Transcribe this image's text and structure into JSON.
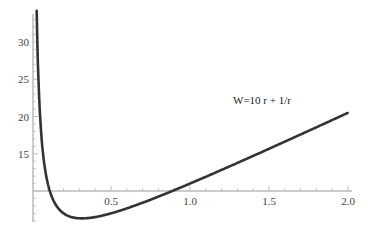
{
  "chart_data": {
    "type": "line",
    "title": "",
    "xlabel": "",
    "ylabel": "",
    "annotation": "W=10 r + 1/r",
    "function": "W = 10*r + 1/r",
    "xlim": [
      0,
      2.0
    ],
    "ylim": [
      6,
      33
    ],
    "axes_origin": {
      "x": 0,
      "y": 10
    },
    "x_ticks": [
      "0.5",
      "1.0",
      "1.5",
      "2.0"
    ],
    "y_ticks": [
      "15",
      "20",
      "25",
      "30"
    ],
    "grid": false,
    "legend": null,
    "series": [
      {
        "name": "W=10 r + 1/r",
        "color": "#333333",
        "x": [
          0.03,
          0.05,
          0.1,
          0.15,
          0.2,
          0.25,
          0.316,
          0.4,
          0.5,
          0.75,
          1.0,
          1.25,
          1.5,
          1.75,
          2.0
        ],
        "y": [
          33.6,
          20.5,
          11.0,
          8.17,
          7.0,
          6.5,
          6.32,
          6.5,
          7.0,
          8.83,
          11.0,
          13.3,
          15.67,
          18.07,
          20.5
        ]
      }
    ]
  }
}
